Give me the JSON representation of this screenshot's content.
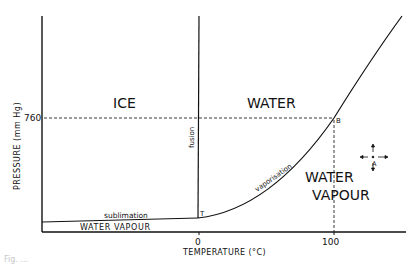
{
  "diagram": {
    "type": "phase-diagram",
    "y_axis_label": "PRESSURE  (mm Hg)",
    "x_axis_label": "TEMPERATURE  (°C)",
    "y_tick": "760",
    "x_ticks": [
      "0",
      "100"
    ],
    "regions": {
      "ice": "ICE",
      "water": "WATER",
      "vapour_line1": "WATER",
      "vapour_line2": "VAPOUR",
      "vapour_strip": "WATER  VAPOUR"
    },
    "curves": {
      "fusion": "fusion",
      "vaporisation": "vaporisation",
      "sublimation": "sublimation"
    },
    "points": {
      "triple": "T",
      "boiling": "B",
      "arbitrary": "A"
    },
    "caption_fragment": "Fig. ..."
  }
}
